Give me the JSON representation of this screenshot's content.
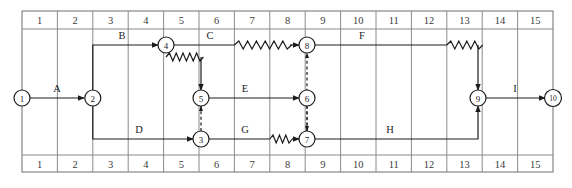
{
  "diagram": {
    "type": "network-time-scaled-arrow-diagram",
    "title": "",
    "grid": {
      "columns": [
        "1",
        "2",
        "3",
        "4",
        "5",
        "6",
        "7",
        "8",
        "9",
        "10",
        "11",
        "12",
        "13",
        "14",
        "15"
      ],
      "column_count": 15,
      "has_top_header": true,
      "has_bottom_header": true,
      "line_color": "#8a8a8a",
      "border_color": "#6e6e6e"
    },
    "nodes": [
      {
        "id": "1",
        "label": "1",
        "x": 22,
        "y": 98
      },
      {
        "id": "2",
        "label": "2",
        "x": 92,
        "y": 98
      },
      {
        "id": "3",
        "label": "3",
        "x": 201,
        "y": 139
      },
      {
        "id": "4",
        "label": "4",
        "x": 166,
        "y": 45
      },
      {
        "id": "5",
        "label": "5",
        "x": 201,
        "y": 98
      },
      {
        "id": "6",
        "label": "6",
        "x": 307,
        "y": 98
      },
      {
        "id": "7",
        "label": "7",
        "x": 307,
        "y": 139
      },
      {
        "id": "8",
        "label": "8",
        "x": 307,
        "y": 45
      },
      {
        "id": "9",
        "label": "9",
        "x": 478,
        "y": 98
      },
      {
        "id": "10",
        "label": "10",
        "x": 553,
        "y": 98
      }
    ],
    "activities": [
      {
        "label": "A",
        "from": "1",
        "to": "2",
        "label_x": 57,
        "label_y": 92
      },
      {
        "label": "B",
        "from": "2",
        "to": "4",
        "label_x": 122,
        "label_y": 39
      },
      {
        "label": "C",
        "from": "4",
        "to": "8",
        "label_x": 210,
        "label_y": 39,
        "has_float": true
      },
      {
        "label": "D",
        "from": "2",
        "to": "3",
        "label_x": 139,
        "label_y": 133
      },
      {
        "label": "E",
        "from": "5",
        "to": "6",
        "label_x": 245,
        "label_y": 92
      },
      {
        "label": "F",
        "from": "8",
        "to": "9",
        "label_x": 362,
        "label_y": 39,
        "has_float": true
      },
      {
        "label": "G",
        "from": "3",
        "to": "7",
        "label_x": 245,
        "label_y": 133,
        "has_float": true
      },
      {
        "label": "H",
        "from": "7",
        "to": "9",
        "label_x": 390,
        "label_y": 133
      },
      {
        "label": "I",
        "from": "9",
        "to": "10",
        "label_x": 515,
        "label_y": 92
      }
    ],
    "dummy_links": [
      {
        "from": "4",
        "to": "5",
        "style": "zigzag-then-down"
      },
      {
        "from": "3",
        "to": "5",
        "style": "dashed-up"
      },
      {
        "from": "6",
        "to": "7",
        "style": "dashed-down"
      },
      {
        "from": "7",
        "to": "8",
        "style": "dashed-up"
      }
    ]
  }
}
